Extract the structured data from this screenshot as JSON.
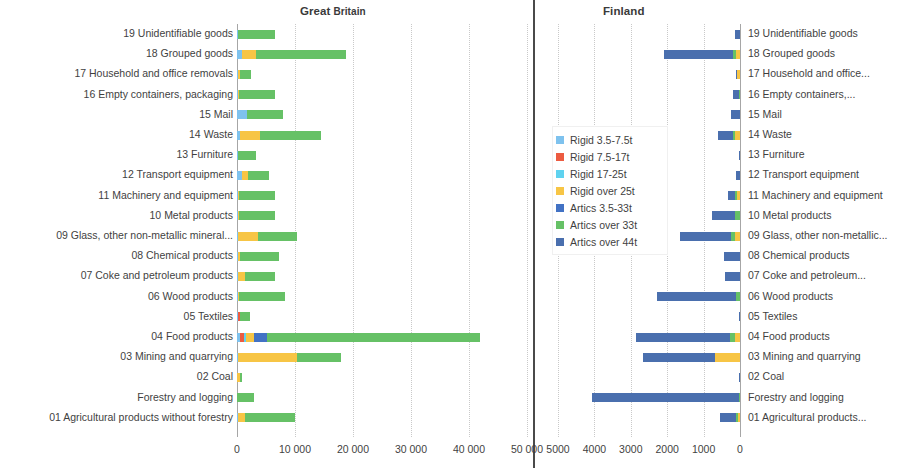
{
  "charts": {
    "gb": {
      "title_main": "Great",
      "title_sub": " Britain",
      "xlabel": "",
      "ticks": [
        "0",
        "10 000",
        "20 000",
        "30 000",
        "40 000",
        "50 000"
      ]
    },
    "fi": {
      "title": "Finland",
      "xlabel": "",
      "ticks": [
        "5000",
        "4000",
        "3000",
        "2000",
        "1000",
        "0"
      ]
    }
  },
  "legend": {
    "items": [
      {
        "label": "Rigid 3.5-7.5t",
        "color": "#7ec2ee"
      },
      {
        "label": "Rigid 7.5-17t",
        "color": "#ec5b41"
      },
      {
        "label": "Rigid 17-25t",
        "color": "#5fd2ef"
      },
      {
        "label": "Rigid over 25t",
        "color": "#f7c545"
      },
      {
        "label": "Artics 3.5-33t",
        "color": "#4272c4"
      },
      {
        "label": "Artics over 33t",
        "color": "#66c166"
      },
      {
        "label": "Artics over 44t",
        "color": "#4a6fae"
      }
    ]
  },
  "chart_data": [
    {
      "type": "bar",
      "orientation": "horizontal",
      "title": "Great Britain",
      "xlabel": "",
      "ylabel": "",
      "xlim": [
        0,
        50000
      ],
      "grid": true,
      "xticks": [
        0,
        10000,
        20000,
        30000,
        40000,
        50000
      ],
      "xticklabels": [
        "0",
        "10 000",
        "20 000",
        "30 000",
        "40 000",
        "50 000"
      ],
      "legend_position": "center",
      "stacked": true,
      "categories": [
        "19 Unidentifiable goods",
        "18 Grouped goods",
        "17 Household and office removals",
        "16 Empty containers, packaging",
        "15 Mail",
        "14 Waste",
        "13 Furniture",
        "12 Transport equipment",
        "11 Machinery and equipment",
        "10 Metal products",
        "09 Glass, other non-metallic mineral...",
        "08 Chemical products",
        "07 Coke and petroleum products",
        "06 Wood products",
        "05 Textiles",
        "04 Food products",
        "03 Mining and quarrying",
        "02 Coal",
        "Forestry and logging",
        "01 Agricultural products without forestry"
      ],
      "series": [
        {
          "name": "Rigid 3.5-7.5t",
          "color": "#7ec2ee",
          "values": [
            200,
            900,
            100,
            200,
            1700,
            600,
            100,
            900,
            200,
            200,
            100,
            200,
            100,
            200,
            100,
            500,
            100,
            0,
            0,
            200
          ]
        },
        {
          "name": "Rigid 7.5-17t",
          "color": "#ec5b41",
          "values": [
            0,
            0,
            0,
            0,
            0,
            0,
            0,
            0,
            0,
            0,
            0,
            0,
            0,
            0,
            400,
            700,
            0,
            0,
            0,
            0
          ]
        },
        {
          "name": "Rigid 17-25t",
          "color": "#5fd2ef",
          "values": [
            0,
            0,
            0,
            0,
            0,
            0,
            0,
            0,
            0,
            0,
            0,
            0,
            0,
            0,
            0,
            300,
            0,
            0,
            0,
            0
          ]
        },
        {
          "name": "Rigid over 25t",
          "color": "#f7c545",
          "values": [
            0,
            2400,
            500,
            100,
            0,
            3300,
            0,
            1000,
            100,
            200,
            3600,
            300,
            1200,
            200,
            0,
            1500,
            10200,
            600,
            0,
            1200
          ]
        },
        {
          "name": "Artics 3.5-33t",
          "color": "#4272c4",
          "values": [
            0,
            0,
            0,
            0,
            0,
            0,
            0,
            0,
            0,
            0,
            0,
            0,
            0,
            0,
            0,
            2200,
            0,
            0,
            0,
            0
          ]
        },
        {
          "name": "Artics over 33t",
          "color": "#66c166",
          "values": [
            6300,
            15500,
            1800,
            6200,
            6200,
            10600,
            3200,
            3700,
            6200,
            6100,
            6700,
            6800,
            5300,
            7800,
            1800,
            36700,
            7700,
            300,
            3000,
            8600
          ]
        },
        {
          "name": "Artics over 44t",
          "color": "#4a6fae",
          "values": [
            0,
            0,
            0,
            0,
            0,
            0,
            0,
            0,
            0,
            0,
            0,
            0,
            0,
            0,
            0,
            0,
            0,
            0,
            0,
            0
          ]
        }
      ]
    },
    {
      "type": "bar",
      "orientation": "horizontal",
      "direction": "reversed",
      "title": "Finland",
      "xlabel": "",
      "ylabel": "",
      "xlim": [
        0,
        5000
      ],
      "grid": true,
      "xticks": [
        5000,
        4000,
        3000,
        2000,
        1000,
        0
      ],
      "xticklabels": [
        "5000",
        "4000",
        "3000",
        "2000",
        "1000",
        "0"
      ],
      "legend_position": "left",
      "stacked": true,
      "categories": [
        "19 Unidentifiable goods",
        "18 Grouped goods",
        "17 Household and office...",
        "16 Empty containers,...",
        "15 Mail",
        "14 Waste",
        "13 Furniture",
        "12 Transport equipment",
        "11 Machinery and equipment",
        "10 Metal products",
        "09 Glass, other non-metallic...",
        "08 Chemical products",
        "07 Coke and petroleum...",
        "06 Wood products",
        "05 Textiles",
        "04 Food products",
        "03 Mining and quarrying",
        "02 Coal",
        " Forestry and logging",
        "01 Agricultural products..."
      ],
      "series": [
        {
          "name": "Rigid 3.5-7.5t",
          "color": "#7ec2ee",
          "values": [
            0,
            0,
            0,
            0,
            0,
            0,
            0,
            0,
            0,
            0,
            0,
            0,
            0,
            0,
            0,
            0,
            0,
            0,
            0,
            0
          ]
        },
        {
          "name": "Rigid 7.5-17t",
          "color": "#ec5b41",
          "values": [
            0,
            0,
            0,
            0,
            0,
            0,
            0,
            0,
            0,
            0,
            0,
            0,
            0,
            0,
            0,
            0,
            0,
            0,
            0,
            0
          ]
        },
        {
          "name": "Rigid 17-25t",
          "color": "#5fd2ef",
          "values": [
            0,
            0,
            0,
            0,
            0,
            0,
            0,
            0,
            0,
            0,
            0,
            0,
            0,
            0,
            0,
            0,
            0,
            0,
            0,
            0
          ]
        },
        {
          "name": "Rigid over 25t",
          "color": "#f7c545",
          "values": [
            0,
            110,
            80,
            0,
            0,
            130,
            0,
            0,
            90,
            0,
            150,
            0,
            0,
            0,
            0,
            130,
            700,
            0,
            0,
            60
          ]
        },
        {
          "name": "Artics 3.5-33t",
          "color": "#4272c4",
          "values": [
            0,
            0,
            0,
            0,
            0,
            0,
            0,
            0,
            0,
            0,
            0,
            0,
            0,
            0,
            0,
            0,
            0,
            0,
            0,
            0
          ]
        },
        {
          "name": "Artics over 33t",
          "color": "#66c166",
          "values": [
            0,
            70,
            0,
            40,
            0,
            50,
            0,
            0,
            60,
            130,
            100,
            0,
            0,
            110,
            0,
            140,
            0,
            0,
            40,
            50
          ]
        },
        {
          "name": "Artics over 44t",
          "color": "#4a6fae",
          "values": [
            130,
            1900,
            40,
            160,
            250,
            430,
            20,
            110,
            170,
            630,
            1410,
            440,
            420,
            2170,
            30,
            2580,
            1970,
            20,
            4020,
            430
          ]
        }
      ]
    }
  ]
}
